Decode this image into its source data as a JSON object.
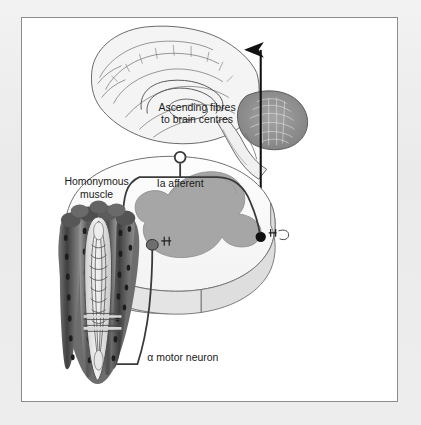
{
  "figure": {
    "type": "anatomical-diagram",
    "background_color": "#ffffff",
    "page_color": "#ededed",
    "frame_border_color": "#8c8c8c",
    "line_color": "#3a3a3a",
    "labels": {
      "ascending_line1": "Ascending fibres",
      "ascending_line2": "to brain centres",
      "homonymous_line1": "Homonymous",
      "homonymous_line2": "muscle",
      "ia_afferent": "Ia afferent",
      "alpha_motor_neuron": "α motor neuron"
    },
    "structures": {
      "brain": {
        "name": "brain-midsagittal",
        "outline_color": "#555555",
        "fill_color": "#f2f2f2",
        "cerebellum_fill": "#8e8e8e"
      },
      "spinal_cord": {
        "name": "spinal-cord-segment",
        "gray_matter_fill": "#a6a6a6",
        "white_matter_fill": "#fbfbfb",
        "surface_fill": "#d6d6d6",
        "outline_color": "#6b6b6b"
      },
      "muscle": {
        "name": "homonymous-muscle",
        "fiber_dark": "#4a4a4a",
        "fiber_mid": "#7c7c7c",
        "fiber_light": "#b5b5b5",
        "spindle_fill": "#dcdcdc",
        "capsule_outline": "#555555"
      },
      "synapse_marker_color": "#111111",
      "arrowhead_color": "#111111"
    }
  }
}
